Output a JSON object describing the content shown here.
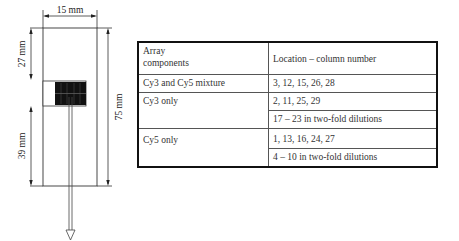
{
  "diagram": {
    "width_label": "15 mm",
    "top_offset_label": "27 mm",
    "bottom_offset_label": "39 mm",
    "length_label": "75 mm"
  },
  "table": {
    "headers": [
      "Array\ncomponents",
      "Location – column number"
    ],
    "header_col1_line1": "Array",
    "header_col1_line2": "components",
    "header_col2": "Location – column number",
    "rows": [
      {
        "component": "Cy3 and Cy5 mixture",
        "locations": [
          "3, 12, 15, 26, 28"
        ]
      },
      {
        "component": "Cy3 only",
        "locations": [
          "2, 11, 25, 29",
          "17 – 23 in two-fold dilutions"
        ]
      },
      {
        "component": "Cy5 only",
        "locations": [
          "1, 13, 16, 24, 27",
          "4 – 10 in two-fold dilutions"
        ]
      }
    ]
  },
  "colors": {
    "line": "#222222",
    "block": "#111111",
    "border": "#111111"
  }
}
